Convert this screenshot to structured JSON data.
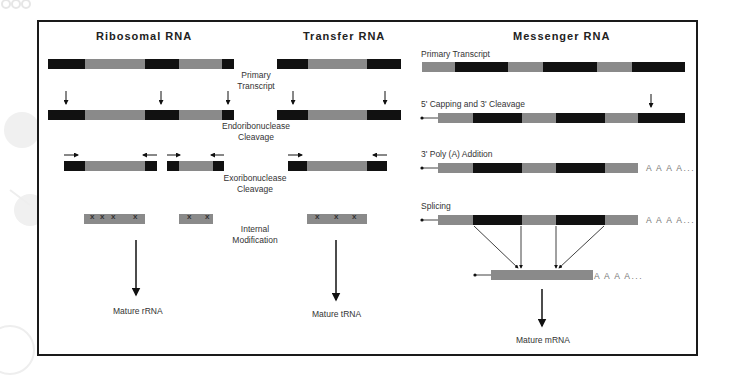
{
  "colors": {
    "exon_black": "#111111",
    "intron_gray": "#8a8a8a",
    "frame": "#1a1a1a",
    "text": "#333333",
    "poly_a": "#777777"
  },
  "columns": {
    "ribosomal": {
      "title": "Ribosomal RNA",
      "mature_label": "Mature rRNA"
    },
    "transfer": {
      "title": "Transfer RNA",
      "mature_label": "Mature tRNA"
    },
    "messenger": {
      "title": "Messenger RNA",
      "mature_label": "Mature mRNA",
      "steps": {
        "primary": "Primary Transcript",
        "capping": "5' Capping and 3' Cleavage",
        "polya": "3' Poly (A) Addition",
        "splicing": "Splicing"
      },
      "poly_a_tail": "A A A A..."
    }
  },
  "shared_steps": {
    "primary_line1": "Primary",
    "primary_line2": "Transcript",
    "endo_line1": "Endoribonuclease",
    "endo_line2": "Cleavage",
    "exo_line1": "Exoribonuclease",
    "exo_line2": "Cleavage",
    "mod_line1": "Internal",
    "mod_line2": "Modification"
  },
  "modification_mark": "x"
}
